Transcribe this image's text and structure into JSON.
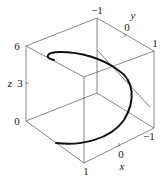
{
  "figure": {
    "type": "3d-parametric-curve"
  },
  "axes": {
    "x": {
      "label": "x",
      "ticks": [
        "1",
        "0",
        "-1"
      ]
    },
    "y": {
      "label": "y",
      "ticks": [
        "-1",
        "0",
        "1"
      ]
    },
    "z": {
      "label": "z",
      "ticks": [
        "0",
        "3",
        "6"
      ]
    }
  },
  "labels": {
    "x_label": "x",
    "y_label": "y",
    "z_label": "z",
    "x_tick_1": "1",
    "x_tick_0": "0",
    "x_tick_m1": "−1",
    "y_tick_m1": "−1",
    "y_tick_0": "0",
    "y_tick_1": "1",
    "z_tick_0": "0",
    "z_tick_3": "3",
    "z_tick_6": "6"
  },
  "colors": {
    "curve": "#111111",
    "box": "#555555",
    "background": "#ffffff"
  }
}
